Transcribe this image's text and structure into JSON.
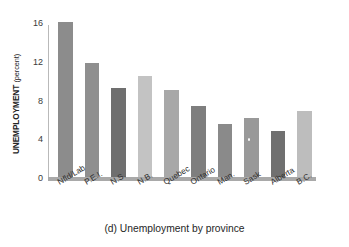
{
  "figure": {
    "caption": "(d) Unemployment by province",
    "ylabel_main": "UNEMPLOYMENT",
    "ylabel_unit": "(percent)"
  },
  "axis": {
    "yticks": [
      "0",
      "4",
      "8",
      "12",
      "16"
    ],
    "ytick_values": [
      0,
      4,
      8,
      12,
      16
    ]
  },
  "chart_data": {
    "type": "bar",
    "title": "(d) Unemployment by province",
    "xlabel": "",
    "ylabel": "UNEMPLOYMENT (percent)",
    "ylim": [
      0,
      16
    ],
    "grid": false,
    "legend": "none",
    "categories": [
      "Nfld/Lab",
      "P.E.I.",
      "N.S.",
      "N.B.",
      "Quebec",
      "Ontario",
      "Man.",
      "Sask",
      "Alberta",
      "B.C."
    ],
    "values": [
      16.0,
      11.8,
      9.2,
      10.4,
      9.0,
      7.3,
      5.5,
      6.1,
      4.7,
      6.8
    ],
    "colors": [
      "#8c8c8c",
      "#8f8f8f",
      "#6f6f6f",
      "#c3c3c3",
      "#a8a8a8",
      "#7e7e7e",
      "#8a8a8a",
      "#999999",
      "#707070",
      "#bdbdbd"
    ]
  }
}
